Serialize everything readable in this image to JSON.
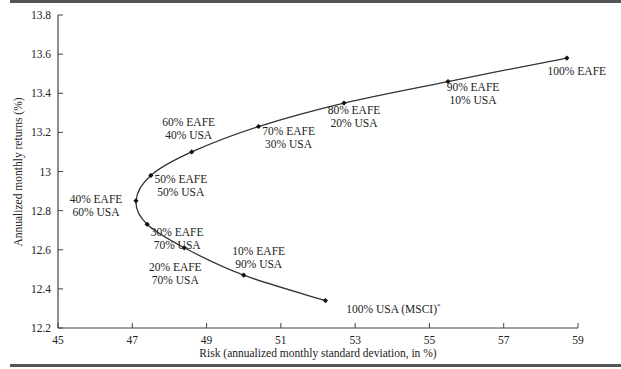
{
  "chart_data": {
    "type": "line",
    "title": "",
    "xlabel": "Risk (annualized monthly standard deviation, in %)",
    "ylabel": "Annualized monthly returns (%)",
    "xlim": [
      45,
      59
    ],
    "ylim": [
      12.2,
      13.8
    ],
    "x_ticks": [
      45,
      47,
      49,
      51,
      53,
      55,
      57,
      59
    ],
    "x_tick_labels": [
      "45",
      "47",
      "49",
      "51",
      "53",
      "55",
      "57",
      "59"
    ],
    "y_ticks": [
      12.2,
      12.4,
      12.6,
      12.8,
      13.0,
      13.2,
      13.4,
      13.6,
      13.8
    ],
    "y_tick_labels": [
      "12.2",
      "12.4",
      "12.6",
      "12.8",
      "13",
      "13.2",
      "13.4",
      "13.6",
      "13.8"
    ],
    "grid": false,
    "legend": null,
    "series": [
      {
        "name": "EAFE / USA efficient frontier",
        "points": [
          {
            "x": 52.2,
            "y": 12.34,
            "label": [
              "100% USA (MSCI)*"
            ]
          },
          {
            "x": 50.0,
            "y": 12.47,
            "label": [
              "10% EAFE",
              "90% USA"
            ]
          },
          {
            "x": 48.4,
            "y": 12.61,
            "label": [
              "20% EAFE",
              "70% USA"
            ]
          },
          {
            "x": 47.4,
            "y": 12.73,
            "label": [
              "30% EAFE",
              "70% USA"
            ]
          },
          {
            "x": 47.1,
            "y": 12.85,
            "label": [
              "40% EAFE",
              "60% USA"
            ]
          },
          {
            "x": 47.5,
            "y": 12.98,
            "label": [
              "50% EAFE",
              "50% USA"
            ]
          },
          {
            "x": 48.6,
            "y": 13.1,
            "label": [
              "60% EAFE",
              "40% USA"
            ]
          },
          {
            "x": 50.4,
            "y": 13.23,
            "label": [
              "70% EAFE",
              "30% USA"
            ]
          },
          {
            "x": 52.7,
            "y": 13.35,
            "label": [
              "80% EAFE",
              "20% USA"
            ]
          },
          {
            "x": 55.5,
            "y": 13.46,
            "label": [
              "90% EAFE",
              "10% USA"
            ]
          },
          {
            "x": 58.7,
            "y": 13.58,
            "label": [
              "100% EAFE"
            ]
          }
        ]
      }
    ],
    "colors": {
      "line": "#333333",
      "marker": "#111111",
      "axis": "#444444",
      "rules": "#555555"
    }
  }
}
